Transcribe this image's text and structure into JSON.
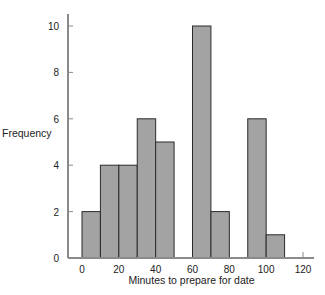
{
  "chart_data": {
    "type": "bar",
    "subtype": "histogram",
    "title": "",
    "xlabel": "Minutes to prepare for date",
    "ylabel": "Frequency",
    "bin_width": 10,
    "bins": [
      {
        "start": 0,
        "end": 10,
        "count": 2
      },
      {
        "start": 10,
        "end": 20,
        "count": 4
      },
      {
        "start": 20,
        "end": 30,
        "count": 4
      },
      {
        "start": 30,
        "end": 40,
        "count": 6
      },
      {
        "start": 40,
        "end": 50,
        "count": 5
      },
      {
        "start": 50,
        "end": 60,
        "count": 0
      },
      {
        "start": 60,
        "end": 70,
        "count": 10
      },
      {
        "start": 70,
        "end": 80,
        "count": 2
      },
      {
        "start": 80,
        "end": 90,
        "count": 0
      },
      {
        "start": 90,
        "end": 100,
        "count": 6
      },
      {
        "start": 100,
        "end": 110,
        "count": 1
      }
    ],
    "categories": [
      "0-10",
      "10-20",
      "20-30",
      "30-40",
      "40-50",
      "50-60",
      "60-70",
      "70-80",
      "80-90",
      "90-100",
      "100-110"
    ],
    "values": [
      2,
      4,
      4,
      6,
      5,
      0,
      10,
      2,
      0,
      6,
      1
    ],
    "x_ticks": [
      0,
      20,
      40,
      60,
      80,
      100,
      120
    ],
    "y_ticks": [
      0,
      2,
      4,
      6,
      8,
      10
    ],
    "xlim": [
      -7,
      125
    ],
    "ylim": [
      0,
      10.5
    ],
    "grid": false,
    "legend": null
  },
  "style": {
    "bar_fill": "#a3a3a3",
    "bar_stroke": "#2b2b2b",
    "axis_color": "#8a8a8a",
    "text_color": "#222222"
  }
}
